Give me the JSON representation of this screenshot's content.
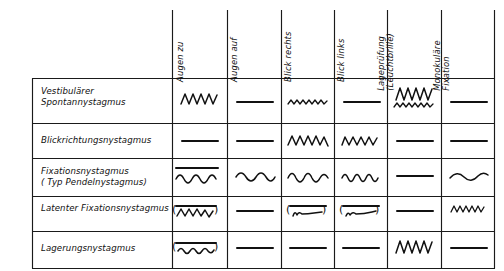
{
  "figure": {
    "kind": "nystagmus-differential-diagnosis-table",
    "background": "#ffffff",
    "line_color": "#1a1a1a"
  },
  "table": {
    "column_headers": [
      {
        "id": "augen-zu",
        "label": "Augen zu",
        "lines": [
          "Augen zu"
        ]
      },
      {
        "id": "augen-auf",
        "label": "Augen auf",
        "lines": [
          "Augen auf"
        ]
      },
      {
        "id": "blick-rechts",
        "label": "Blick rechts",
        "lines": [
          "Blick rechts"
        ]
      },
      {
        "id": "blick-links",
        "label": "Blick links",
        "lines": [
          "Blick links"
        ]
      },
      {
        "id": "lagepruefung",
        "label": "Lageprüfung (Leuchtbrille)",
        "lines": [
          "Lageprüfung",
          "(Leuchtbrille)"
        ]
      },
      {
        "id": "monokulaere-fixation",
        "label": "Monokuläre Fixation",
        "lines": [
          "Monokuläre",
          "Fixation"
        ]
      }
    ],
    "rows": [
      {
        "id": "vestibulaerer-spontannystagmus",
        "lines": [
          "Vestibulärer",
          "Spontannystagmus"
        ],
        "cells": [
          {
            "col": "augen-zu",
            "trace": "sawtooth-large-right"
          },
          {
            "col": "augen-auf",
            "trace": "flat"
          },
          {
            "col": "blick-rechts",
            "trace": "sawtooth-small-right"
          },
          {
            "col": "blick-links",
            "trace": "flat"
          },
          {
            "col": "lagepruefung",
            "trace": "sawtooth-large-right + sawtooth-small-right"
          },
          {
            "col": "monokulaere-fixation",
            "trace": "flat"
          }
        ]
      },
      {
        "id": "blickrichtungsnystagmus",
        "lines": [
          "Blickrichtungsnystagmus"
        ],
        "cells": [
          {
            "col": "augen-zu",
            "trace": "flat"
          },
          {
            "col": "augen-auf",
            "trace": "flat"
          },
          {
            "col": "blick-rechts",
            "trace": "sawtooth-medium-right"
          },
          {
            "col": "blick-links",
            "trace": "sawtooth-medium-left"
          },
          {
            "col": "lagepruefung",
            "trace": "flat"
          },
          {
            "col": "monokulaere-fixation",
            "trace": "flat"
          }
        ]
      },
      {
        "id": "fixationsnystagmus",
        "lines": [
          "Fixationsnystagmus",
          "( Typ Pendelnystagmus)"
        ],
        "cells": [
          {
            "col": "augen-zu",
            "trace": "flat + sine-medium"
          },
          {
            "col": "augen-auf",
            "trace": "sine-medium"
          },
          {
            "col": "blick-rechts",
            "trace": "sine-medium"
          },
          {
            "col": "blick-links",
            "trace": "sine-small"
          },
          {
            "col": "lagepruefung",
            "trace": "flat"
          },
          {
            "col": "monokulaere-fixation",
            "trace": "sine-wide"
          }
        ]
      },
      {
        "id": "latenter-fixationsnystagmus",
        "lines": [
          "Latenter Fixationsnystagmus"
        ],
        "cells": [
          {
            "col": "augen-zu",
            "trace": "flat + (sawtooth-small-right)"
          },
          {
            "col": "augen-auf",
            "trace": "flat"
          },
          {
            "col": "blick-rechts",
            "trace": "flat + (decay-right)"
          },
          {
            "col": "blick-links",
            "trace": "flat + (decay-right)"
          },
          {
            "col": "lagepruefung",
            "trace": "flat"
          },
          {
            "col": "monokulaere-fixation",
            "trace": "sawtooth-small-right"
          }
        ]
      },
      {
        "id": "lagerungsnystagmus",
        "lines": [
          "Lagerungsnystagmus"
        ],
        "cells": [
          {
            "col": "augen-zu",
            "trace": "flat + (sine-small)"
          },
          {
            "col": "augen-auf",
            "trace": "flat"
          },
          {
            "col": "blick-rechts",
            "trace": "flat"
          },
          {
            "col": "blick-links",
            "trace": "flat"
          },
          {
            "col": "lagepruefung",
            "trace": "sawtooth-large-right"
          },
          {
            "col": "monokulaere-fixation",
            "trace": "flat"
          }
        ]
      }
    ]
  }
}
